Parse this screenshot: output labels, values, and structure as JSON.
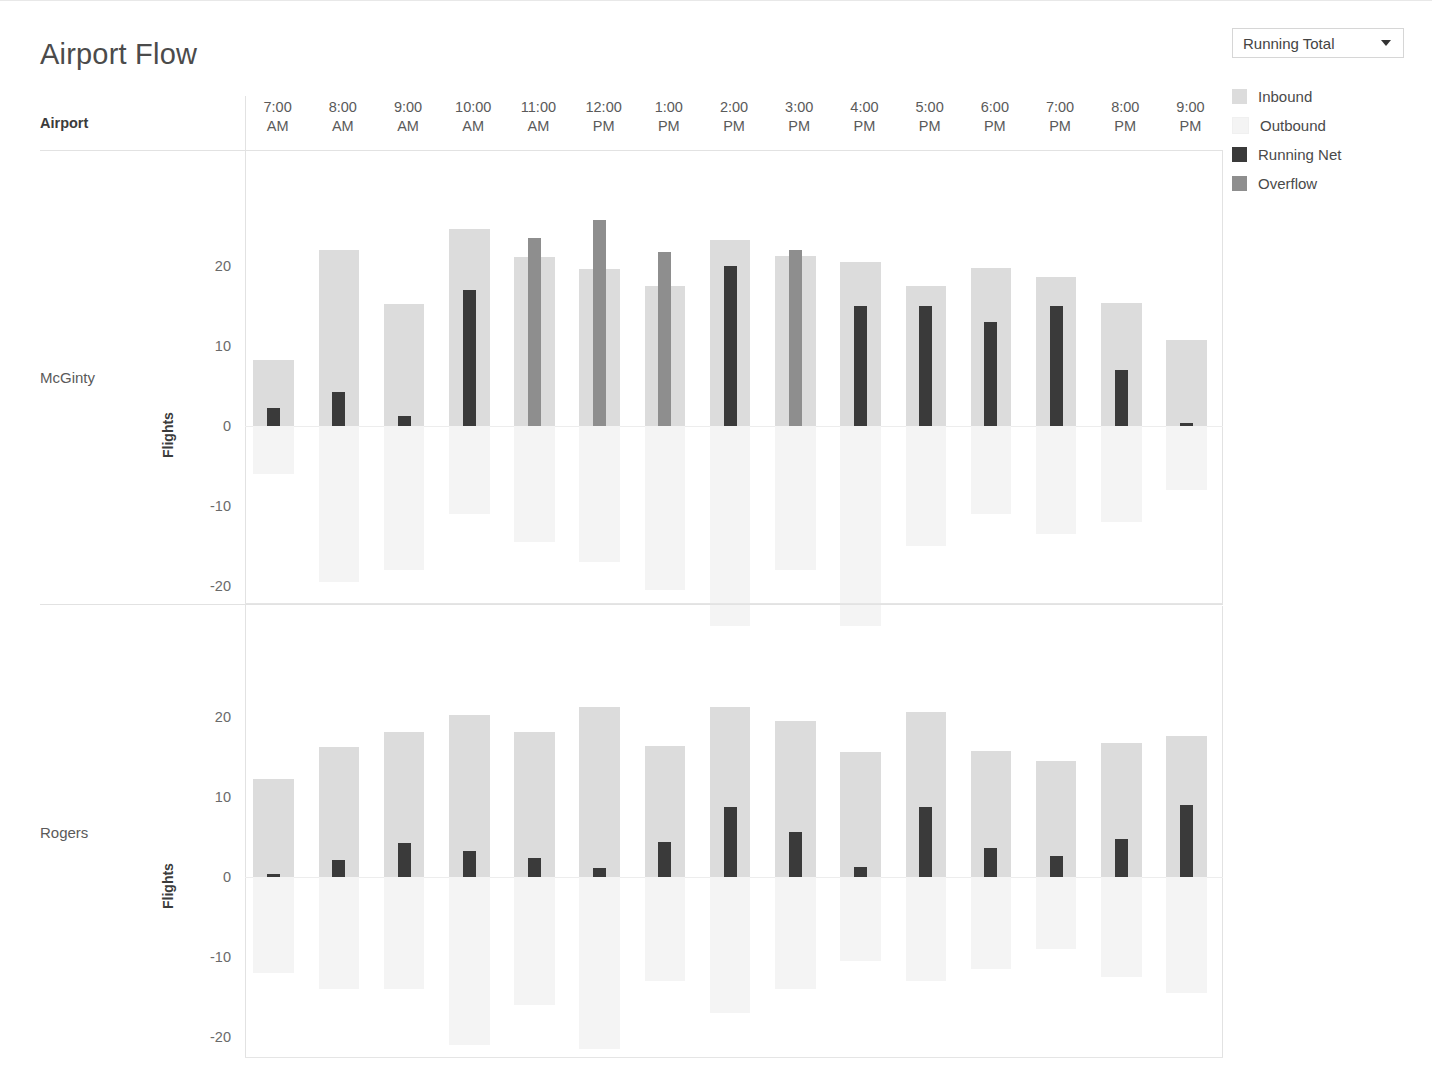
{
  "page": {
    "title": "Airport Flow"
  },
  "controls": {
    "dropdown": {
      "name": "measure-selector",
      "value": "Running Total",
      "caret_icon": "chevron-down-icon"
    }
  },
  "legend": {
    "items": [
      {
        "label": "Inbound",
        "color": "#dcdcdc"
      },
      {
        "label": "Outbound",
        "color": "#f4f4f4"
      },
      {
        "label": "Running Net",
        "color": "#3a3a3a"
      },
      {
        "label": "Overflow",
        "color": "#8e8e8e"
      }
    ]
  },
  "table": {
    "row_header_label": "Airport",
    "column_headers": [
      {
        "time": "7:00",
        "meridiem": "AM"
      },
      {
        "time": "8:00",
        "meridiem": "AM"
      },
      {
        "time": "9:00",
        "meridiem": "AM"
      },
      {
        "time": "10:00",
        "meridiem": "AM"
      },
      {
        "time": "11:00",
        "meridiem": "AM"
      },
      {
        "time": "12:00",
        "meridiem": "PM"
      },
      {
        "time": "1:00",
        "meridiem": "PM"
      },
      {
        "time": "2:00",
        "meridiem": "PM"
      },
      {
        "time": "3:00",
        "meridiem": "PM"
      },
      {
        "time": "4:00",
        "meridiem": "PM"
      },
      {
        "time": "5:00",
        "meridiem": "PM"
      },
      {
        "time": "6:00",
        "meridiem": "PM"
      },
      {
        "time": "7:00",
        "meridiem": "PM"
      },
      {
        "time": "8:00",
        "meridiem": "PM"
      },
      {
        "time": "9:00",
        "meridiem": "PM"
      }
    ],
    "rows": [
      {
        "label": "McGinty",
        "axis_title": "Flights"
      },
      {
        "label": "Rogers",
        "axis_title": "Flights"
      }
    ]
  },
  "chart_data": [
    {
      "type": "bar",
      "title": "McGinty",
      "xlabel": "",
      "ylabel": "Flights",
      "ylim": [
        -28,
        27
      ],
      "yticks": [
        20,
        10,
        0,
        -10,
        -20
      ],
      "ytick_labels": [
        "20",
        "10",
        "0",
        "-10",
        "-20"
      ],
      "grid": false,
      "legend_position": "right",
      "categories": [
        "7:00 AM",
        "8:00 AM",
        "9:00 AM",
        "10:00 AM",
        "11:00 AM",
        "12:00 PM",
        "1:00 PM",
        "2:00 PM",
        "3:00 PM",
        "4:00 PM",
        "5:00 PM",
        "6:00 PM",
        "7:00 PM",
        "8:00 PM",
        "9:00 PM"
      ],
      "series": [
        {
          "name": "Inbound",
          "color": "#dcdcdc",
          "values": [
            8.3,
            22.0,
            15.2,
            24.6,
            21.1,
            19.6,
            17.5,
            23.3,
            21.3,
            20.5,
            17.5,
            19.8,
            18.6,
            15.4,
            10.8
          ]
        },
        {
          "name": "Outbound",
          "color": "#f4f4f4",
          "values": [
            -6.0,
            -19.5,
            -18.0,
            -11.0,
            -14.5,
            -17.0,
            -20.5,
            -25.0,
            -18.0,
            -25.0,
            -15.0,
            -11.0,
            -13.5,
            -12.0,
            -8.0
          ]
        },
        {
          "name": "Running Net",
          "color": "#3a3a3a",
          "values": [
            2.2,
            4.3,
            1.3,
            17.0,
            null,
            null,
            null,
            20.0,
            null,
            15.0,
            15.0,
            13.0,
            15.0,
            7.0,
            0.4
          ]
        },
        {
          "name": "Overflow",
          "color": "#8e8e8e",
          "values": [
            null,
            null,
            null,
            null,
            23.5,
            25.7,
            21.8,
            null,
            22.0,
            null,
            null,
            null,
            null,
            null,
            null
          ]
        }
      ]
    },
    {
      "type": "bar",
      "title": "Rogers",
      "xlabel": "",
      "ylabel": "Flights",
      "ylim": [
        -28,
        27
      ],
      "yticks": [
        20,
        10,
        0,
        -10,
        -20
      ],
      "ytick_labels": [
        "20",
        "10",
        "0",
        "-10",
        "-20"
      ],
      "grid": false,
      "legend_position": "right",
      "categories": [
        "7:00 AM",
        "8:00 AM",
        "9:00 AM",
        "10:00 AM",
        "11:00 AM",
        "12:00 PM",
        "1:00 PM",
        "2:00 PM",
        "3:00 PM",
        "4:00 PM",
        "5:00 PM",
        "6:00 PM",
        "7:00 PM",
        "8:00 PM",
        "9:00 PM"
      ],
      "series": [
        {
          "name": "Inbound",
          "color": "#dcdcdc",
          "values": [
            12.2,
            16.2,
            18.1,
            20.3,
            18.1,
            21.2,
            16.4,
            21.3,
            19.5,
            15.6,
            20.6,
            15.7,
            14.5,
            16.7,
            17.6
          ]
        },
        {
          "name": "Outbound",
          "color": "#f4f4f4",
          "values": [
            -12.0,
            -14.0,
            -14.0,
            -21.0,
            -16.0,
            -21.5,
            -13.0,
            -17.0,
            -14.0,
            -10.5,
            -13.0,
            -11.5,
            -9.0,
            -12.5,
            -14.5
          ]
        },
        {
          "name": "Running Net",
          "color": "#3a3a3a",
          "values": [
            0.2,
            2.1,
            4.2,
            3.3,
            2.4,
            1.1,
            4.4,
            8.7,
            5.6,
            1.3,
            8.8,
            3.6,
            2.6,
            4.7,
            9.0
          ]
        },
        {
          "name": "Overflow",
          "color": "#8e8e8e",
          "values": [
            null,
            null,
            null,
            null,
            null,
            null,
            null,
            null,
            null,
            null,
            null,
            null,
            null,
            null,
            null
          ]
        }
      ]
    }
  ]
}
